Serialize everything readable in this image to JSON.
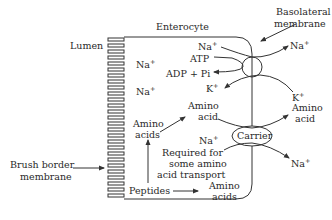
{
  "labels": {
    "enterocyte": "Enterocyte",
    "lumen": "Lumen",
    "basolateral_line1": "Basolateral",
    "basolateral_line2": "membrane",
    "brush_line1": "Brush border",
    "brush_line2": "membrane",
    "carrier": "Carrier",
    "na": "Na",
    "k": "K",
    "plus": "+",
    "atp": "ATP",
    "adp_pi": "ADP + Pi",
    "amino": "Amino",
    "acid": "acid",
    "acids": "acids",
    "required_line1": "Required for",
    "required_line2": "some amino",
    "required_line3": "acid transport",
    "peptides": "Peptides"
  },
  "colors": {
    "ink": "#333333",
    "background": "#ffffff"
  }
}
